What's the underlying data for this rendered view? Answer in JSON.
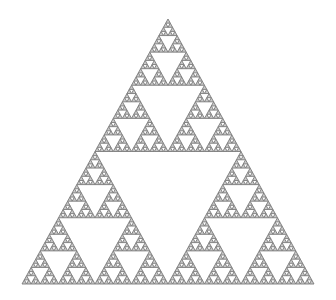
{
  "figure": {
    "kind": "sierpinski-triangle",
    "depth": 6,
    "apex": [
      168,
      19
    ],
    "bottom_left": [
      22,
      284
    ],
    "bottom_right": [
      314,
      284
    ],
    "colors": {
      "background": "#ffffff",
      "stroke": "#7a7a7a",
      "fill": "#c8c8c8",
      "hole": "#ffffff"
    },
    "stroke_width": 0.9
  }
}
